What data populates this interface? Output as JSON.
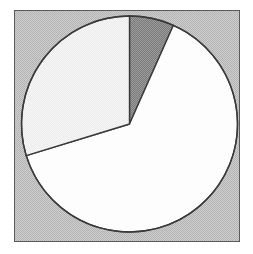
{
  "figure": {
    "kind": "pie-chart-image",
    "background_color": "#ffffff",
    "frame": {
      "fill_color": "#b3b3b3",
      "border_color": "#5a5a5a",
      "x": 14,
      "y": 10,
      "width": 226,
      "height": 232
    }
  },
  "chart_data": {
    "type": "pie",
    "title": "",
    "subtitle": "",
    "xlabel": "",
    "ylabel": "",
    "grid": false,
    "legend": "none",
    "start_angle_deg": 0,
    "direction": "clockwise",
    "center": {
      "cx": 129.5,
      "cy": 124
    },
    "radius": 108,
    "outline_color": "#3a3a3a",
    "outline_width": 1.4,
    "categories": [
      "Slice 1",
      "Slice 2",
      "Slice 3"
    ],
    "values": [
      6.7,
      63.6,
      29.7
    ],
    "labels": [
      "",
      "",
      ""
    ],
    "slices": [
      {
        "name": "Slice 1",
        "value": 6.7,
        "percent": 6.7,
        "color": "#8a8a8a",
        "start_angle_deg": 0,
        "end_angle_deg": 24,
        "shade": "dark-gray"
      },
      {
        "name": "Slice 2",
        "value": 63.6,
        "percent": 63.6,
        "color": "#fbfbfb",
        "start_angle_deg": 24,
        "end_angle_deg": 253,
        "shade": "white"
      },
      {
        "name": "Slice 3",
        "value": 29.7,
        "percent": 29.7,
        "color": "#eeeeee",
        "start_angle_deg": 253,
        "end_angle_deg": 360,
        "shade": "light-gray"
      }
    ]
  }
}
